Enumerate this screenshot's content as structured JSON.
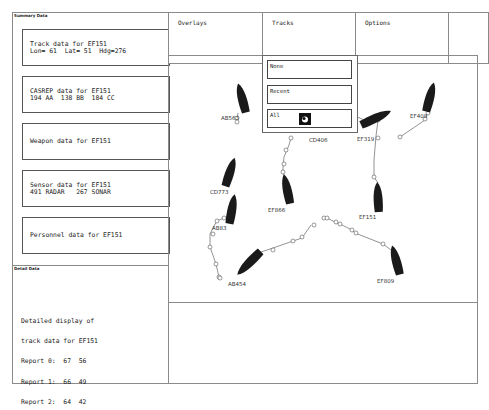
{
  "summary_panel": {
    "title": "Summary Data",
    "cards": [
      {
        "line1": "Track data for EF151",
        "line2": "Lon= 61  Lat= 51  Hdg=276"
      },
      {
        "line1": "CASREP data for EF151",
        "line2": "194 AA  138 BB  184 CC"
      },
      {
        "line1": "Weapon data for EF151",
        "line2": ""
      },
      {
        "line1": "Sensor data for EF151",
        "line2": "491 RADAR   267 SONAR"
      },
      {
        "line1": "Personnel data for EF151",
        "line2": ""
      }
    ]
  },
  "detail_panel": {
    "title": "Detail Data",
    "lines": [
      "Detailed display of",
      "track data for EF151",
      "Report 0:  67  56",
      "Report 1:  66  49",
      "Report 2:  64  42"
    ]
  },
  "menubar": {
    "items": [
      {
        "label": "Overlays"
      },
      {
        "label": "Tracks"
      },
      {
        "label": "Options"
      },
      {
        "label": ""
      }
    ]
  },
  "tracks_dropdown": {
    "options": [
      {
        "label": "None"
      },
      {
        "label": "Recent"
      },
      {
        "label": "All",
        "selected": true
      }
    ],
    "cursor_icon": "pointer-cursor-icon"
  },
  "map": {
    "ships": [
      {
        "id": "AB563",
        "label": "AB563"
      },
      {
        "id": "CD406",
        "label": "CD406"
      },
      {
        "id": "EF319",
        "label": "EF319"
      },
      {
        "id": "EF408",
        "label": "EF408"
      },
      {
        "id": "CD773",
        "label": "CD773"
      },
      {
        "id": "EF866",
        "label": "EF866"
      },
      {
        "id": "AB83",
        "label": "AB83"
      },
      {
        "id": "EF151",
        "label": "EF151"
      },
      {
        "id": "AB454",
        "label": "AB454"
      },
      {
        "id": "EF809",
        "label": "EF809"
      }
    ]
  },
  "colors": {
    "ship_fill": "#1a1a1a",
    "border": "#8a8a8a",
    "track_line": "#666666"
  }
}
